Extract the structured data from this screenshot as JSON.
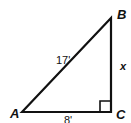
{
  "diagram": {
    "type": "right-triangle",
    "vertices": {
      "A": {
        "label": "A"
      },
      "B": {
        "label": "B"
      },
      "C": {
        "label": "C"
      }
    },
    "sides": {
      "hypotenuse_AB": "17'",
      "leg_BC": "x",
      "leg_AC": "8'"
    },
    "right_angle_at": "C",
    "colors": {
      "stroke": "#111111",
      "background": "#ffffff"
    }
  }
}
